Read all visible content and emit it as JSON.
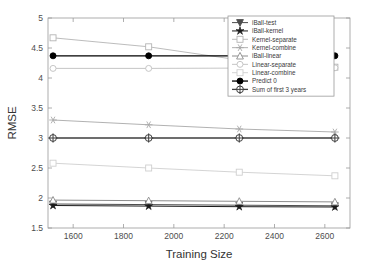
{
  "chart_data": {
    "type": "line",
    "title": "",
    "xlabel": "Training Size",
    "ylabel": "RMSE",
    "xlim": [
      1500,
      2700
    ],
    "ylim": [
      1.5,
      5
    ],
    "xticks": [
      1600,
      1800,
      2000,
      2200,
      2400,
      2600
    ],
    "xticklabels": [
      "1600",
      "1800",
      "2000",
      "2200",
      "2400",
      "2600"
    ],
    "yticks": [
      1.5,
      2,
      2.5,
      3,
      3.5,
      4,
      4.5,
      5
    ],
    "yticklabels": [
      "1.5",
      "2",
      "2.5",
      "3",
      "3.5",
      "4",
      "4.5",
      "5"
    ],
    "grid": false,
    "legend_position": "upper right",
    "x": [
      1520,
      1900,
      2260,
      2640
    ],
    "series": [
      {
        "name": "iBall-test",
        "values": [
          1.9,
          1.89,
          1.88,
          1.87
        ],
        "color": "#4d4d4d",
        "marker": "triangle-down",
        "marker_filled": true,
        "linewidth": 1.0
      },
      {
        "name": "iBall-kernel",
        "values": [
          1.875,
          1.865,
          1.855,
          1.85
        ],
        "color": "#1a1a1a",
        "marker": "star",
        "marker_filled": true,
        "linewidth": 1.0
      },
      {
        "name": "Kernel-separate",
        "values": [
          4.67,
          4.52,
          4.3,
          4.18
        ],
        "color": "#b4b4b4",
        "marker": "square",
        "marker_filled": false,
        "linewidth": 0.9
      },
      {
        "name": "Kernel-combine",
        "values": [
          3.3,
          3.22,
          3.15,
          3.1
        ],
        "color": "#a8a8a8",
        "marker": "asterisk",
        "marker_filled": false,
        "linewidth": 0.9
      },
      {
        "name": "iBall-linear",
        "values": [
          1.965,
          1.955,
          1.945,
          1.935
        ],
        "color": "#8c8c8c",
        "marker": "triangle-up",
        "marker_filled": false,
        "linewidth": 1.0
      },
      {
        "name": "Linear-separate",
        "values": [
          4.16,
          4.16,
          4.165,
          4.17
        ],
        "color": "#bfbfbf",
        "marker": "circle",
        "marker_filled": false,
        "linewidth": 0.9
      },
      {
        "name": "Linear-combine",
        "values": [
          2.58,
          2.5,
          2.43,
          2.37
        ],
        "color": "#cfcfcf",
        "marker": "square",
        "marker_filled": false,
        "linewidth": 0.9
      },
      {
        "name": "Predict 0",
        "values": [
          4.37,
          4.37,
          4.37,
          4.37
        ],
        "color": "#000000",
        "marker": "circle",
        "marker_filled": true,
        "linewidth": 1.3
      },
      {
        "name": "Sum of first 3 years",
        "values": [
          3.0,
          3.0,
          3.0,
          3.0
        ],
        "color": "#3d3d3d",
        "marker": "circle-dot",
        "marker_filled": false,
        "linewidth": 1.3
      }
    ]
  }
}
